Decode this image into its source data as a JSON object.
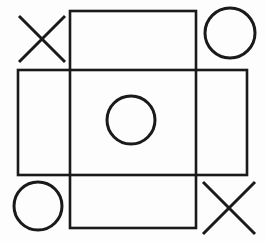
{
  "board": {
    "title": "Tic Tac Toe",
    "background_color": "#fdfdfd",
    "ink_color": "#1a1a1a",
    "grid_style": "crossed-rectangles",
    "grid_line_width": 2.6,
    "mark_line_width": 3.0,
    "rows": 3,
    "columns": 3,
    "horizontal_band": {
      "x1": 18,
      "y1": 70,
      "x2": 247,
      "y2": 175
    },
    "vertical_band": {
      "x1": 70,
      "y1": 11,
      "x2": 196,
      "y2": 228
    },
    "column_dividers": [
      70,
      196
    ],
    "row_dividers": [
      70,
      175
    ],
    "cells": [
      {
        "index": 0,
        "row": 0,
        "col": 0,
        "name": "top-left",
        "mark": "X",
        "cx": 42,
        "cy": 39,
        "size": 46
      },
      {
        "index": 1,
        "row": 0,
        "col": 1,
        "name": "top-center",
        "mark": "",
        "cx": 133,
        "cy": 40,
        "size": 46
      },
      {
        "index": 2,
        "row": 0,
        "col": 2,
        "name": "top-right",
        "mark": "O",
        "cx": 230,
        "cy": 33,
        "size": 50
      },
      {
        "index": 3,
        "row": 1,
        "col": 0,
        "name": "middle-left",
        "mark": "",
        "cx": 44,
        "cy": 122,
        "size": 48
      },
      {
        "index": 4,
        "row": 1,
        "col": 1,
        "name": "center",
        "mark": "O",
        "cx": 131,
        "cy": 120,
        "size": 48
      },
      {
        "index": 5,
        "row": 1,
        "col": 2,
        "name": "middle-right",
        "mark": "",
        "cx": 221,
        "cy": 122,
        "size": 48
      },
      {
        "index": 6,
        "row": 2,
        "col": 0,
        "name": "bottom-left",
        "mark": "O",
        "cx": 38,
        "cy": 206,
        "size": 48
      },
      {
        "index": 7,
        "row": 2,
        "col": 1,
        "name": "bottom-center",
        "mark": "",
        "cx": 133,
        "cy": 201,
        "size": 46
      },
      {
        "index": 8,
        "row": 2,
        "col": 2,
        "name": "bottom-right",
        "mark": "X",
        "cx": 229,
        "cy": 208,
        "size": 52
      }
    ],
    "marks_legend": {
      "x_label": "X",
      "o_label": "O",
      "empty_label": ""
    },
    "summary": "X top-left, O top-right, O center, O bottom-left, X bottom-right"
  }
}
